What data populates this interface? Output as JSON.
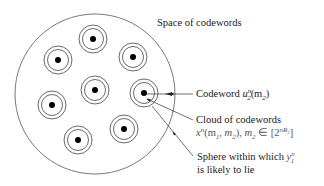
{
  "diagram": {
    "title": "Space of codewords",
    "annotations": {
      "codeword": {
        "label": "Codeword",
        "symbol_base": "u",
        "symbol_sup": "n",
        "symbol_sub": "2",
        "symbol_arg": "(m",
        "symbol_arg_sub": "2",
        "symbol_close": ")"
      },
      "cloud": {
        "line1": "Cloud of codewords",
        "line2_base": "x",
        "line2_sup": "n",
        "line2_args": "(m",
        "line2_sub1": "1",
        "line2_mid": ", m",
        "line2_sub2": "2",
        "line2_close": "),",
        "line2_m": "m",
        "line2_m_sub": "2",
        "line2_in": " ∈ [2",
        "line2_exp": "nR",
        "line2_exp_sub": "2",
        "line2_end": "]"
      },
      "sphere": {
        "line1_text": "Sphere within which ",
        "line1_sym": "y",
        "line1_sup": "n",
        "line1_sub": "1",
        "line2": "is likely to lie"
      }
    },
    "outer_circle": {
      "cx": 95,
      "cy": 94,
      "r": 80
    },
    "clouds": [
      {
        "cx": 93,
        "cy": 39
      },
      {
        "cx": 58,
        "cy": 60
      },
      {
        "cx": 133,
        "cy": 57
      },
      {
        "cx": 95,
        "cy": 90
      },
      {
        "cx": 144,
        "cy": 93
      },
      {
        "cx": 52,
        "cy": 105
      },
      {
        "cx": 124,
        "cy": 129
      },
      {
        "cx": 78,
        "cy": 140
      }
    ],
    "cloud_radii": {
      "outer": 14,
      "inner": 10.5,
      "dot": 3
    },
    "colors": {
      "stroke": "#444444",
      "dot": "#000000",
      "text": "#1a1a1a"
    }
  }
}
